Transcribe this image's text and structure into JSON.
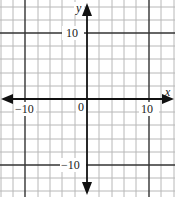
{
  "graph": {
    "x_axis_label": "x",
    "y_axis_label": "y",
    "origin_label": "0",
    "tick_labels": {
      "x_neg": "−10",
      "x_pos": "10",
      "y_pos": "10",
      "y_neg": "−10"
    },
    "x_range": [
      -14,
      14
    ],
    "y_range": [
      -14,
      14
    ],
    "grid_step": 2,
    "highlight_lines": [
      -10,
      10
    ],
    "colors": {
      "grid": "#b8b8b8",
      "highlight": "#333333",
      "axis": "#111111",
      "background": "#ffffff"
    }
  }
}
